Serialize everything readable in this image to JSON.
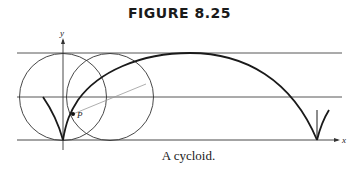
{
  "figure": {
    "title": "FIGURE 8.25",
    "caption": "A cycloid."
  },
  "diagram": {
    "axes": {
      "x_label": "x",
      "y_label": "y"
    },
    "point_label": "P",
    "elements": [
      "three horizontal lines (top tangent, center line, baseline)",
      "two rolling circles",
      "cycloid arch with cusps",
      "radius segment to point P"
    ],
    "colors": {
      "ink": "#1a1a1a",
      "thin": "#444444",
      "radius": "#888888"
    }
  }
}
